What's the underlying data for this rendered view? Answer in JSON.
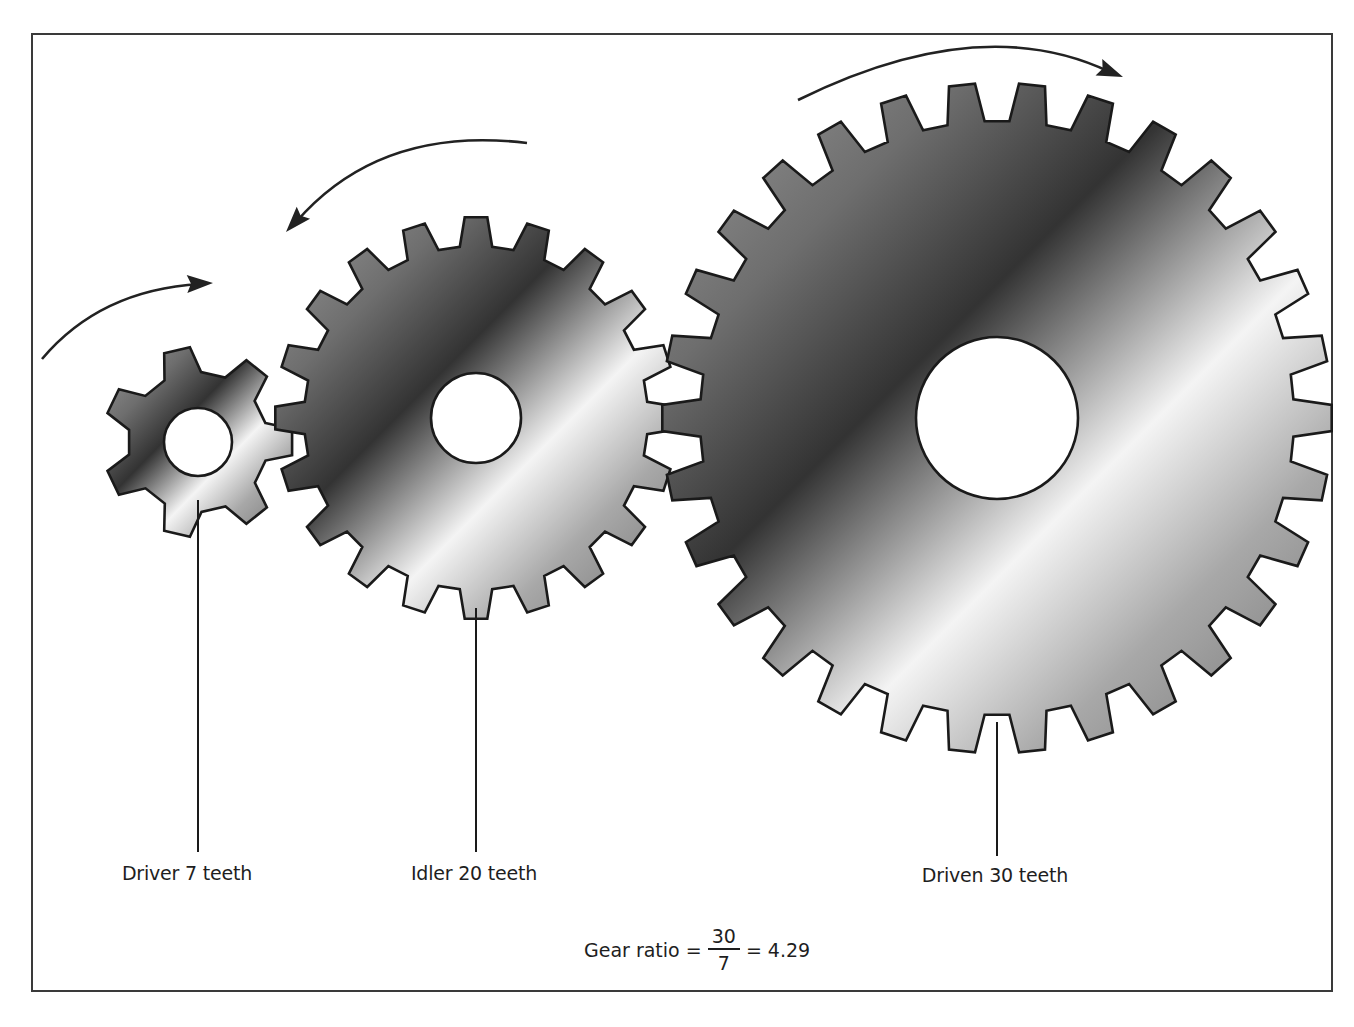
{
  "figure": {
    "type": "gear train diagram",
    "colors": {
      "frame": "#3a3a3a",
      "outline": "#1a1a1a",
      "arrow": "#222222",
      "gradient_stops": [
        "#9a9a9a",
        "#6e6e6e",
        "#333333",
        "#9c9c9c",
        "#f4f4f4",
        "#a8a8a8",
        "#707070"
      ]
    }
  },
  "gears": [
    {
      "name": "driver",
      "label": "Driver 7 teeth",
      "teeth": 7,
      "cx": 198,
      "cy": 442,
      "tip_r": 95,
      "root_r": 70,
      "hole_r": 34,
      "phase_deg": 0,
      "label_x": 187,
      "label_y": 862,
      "leader": {
        "x": 198,
        "y1": 500,
        "y2": 852
      }
    },
    {
      "name": "idler",
      "label": "Idler 20 teeth",
      "teeth": 20,
      "cx": 476,
      "cy": 418,
      "tip_r": 201,
      "root_r": 172,
      "hole_r": 45,
      "phase_deg": -90,
      "label_x": 474,
      "label_y": 862,
      "leader": {
        "x": 476,
        "y1": 608,
        "y2": 852
      }
    },
    {
      "name": "driven",
      "label": "Driven 30 teeth",
      "teeth": 30,
      "cx": 997,
      "cy": 418,
      "tip_r": 335,
      "root_r": 297,
      "hole_r": 81,
      "phase_deg": 84,
      "label_x": 995,
      "label_y": 864,
      "leader": {
        "x": 997,
        "y1": 722,
        "y2": 856
      }
    }
  ],
  "arrows": [
    {
      "name": "driver-rotation-arrow",
      "direction": "clockwise",
      "path": "M42,359 Q100,290 200,284",
      "tip": [
        213,
        283
      ],
      "angle_deg": -2
    },
    {
      "name": "idler-rotation-arrow",
      "direction": "counterclockwise",
      "path": "M527,143 Q380,125 296,222",
      "tip": [
        286,
        232
      ],
      "angle_deg": 132
    },
    {
      "name": "driven-rotation-arrow",
      "direction": "clockwise",
      "path": "M798,100 Q980,10 1110,72",
      "tip": [
        1123,
        77
      ],
      "angle_deg": 22
    }
  ],
  "formula": {
    "prefix": "Gear ratio =",
    "numerator": "30",
    "denominator": "7",
    "suffix": "= 4.29"
  }
}
